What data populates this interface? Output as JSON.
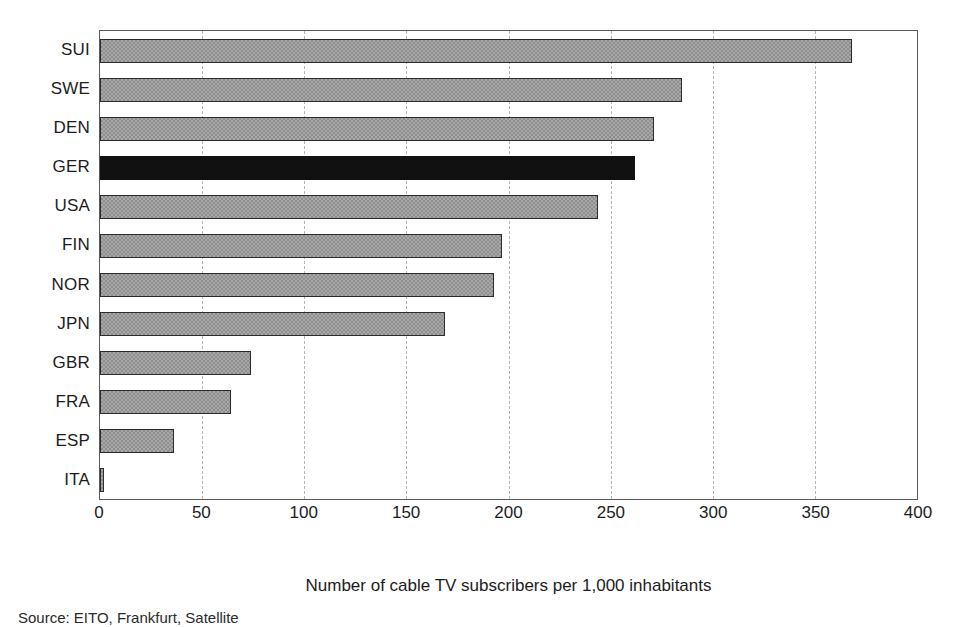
{
  "chart_data": {
    "type": "bar",
    "orientation": "horizontal",
    "title": "",
    "xlabel": "Number of cable TV subscribers per 1,000 inhabitants",
    "ylabel": "",
    "xlim": [
      0,
      400
    ],
    "xticks": [
      0,
      50,
      100,
      150,
      200,
      250,
      300,
      350,
      400
    ],
    "grid": true,
    "legend": false,
    "categories": [
      "SUI",
      "SWE",
      "DEN",
      "GER",
      "USA",
      "FIN",
      "NOR",
      "JPN",
      "GBR",
      "FRA",
      "ESP",
      "ITA"
    ],
    "values": [
      368,
      285,
      271,
      262,
      244,
      197,
      193,
      169,
      74,
      64,
      36,
      2
    ],
    "highlight_category": "GER",
    "bars": [
      {
        "category": "SUI",
        "value": 368,
        "style": "hatched"
      },
      {
        "category": "SWE",
        "value": 285,
        "style": "hatched"
      },
      {
        "category": "DEN",
        "value": 271,
        "style": "hatched"
      },
      {
        "category": "GER",
        "value": 262,
        "style": "solid-black"
      },
      {
        "category": "USA",
        "value": 244,
        "style": "hatched"
      },
      {
        "category": "FIN",
        "value": 197,
        "style": "hatched"
      },
      {
        "category": "NOR",
        "value": 193,
        "style": "hatched"
      },
      {
        "category": "JPN",
        "value": 169,
        "style": "hatched"
      },
      {
        "category": "GBR",
        "value": 74,
        "style": "hatched"
      },
      {
        "category": "FRA",
        "value": 64,
        "style": "hatched"
      },
      {
        "category": "ESP",
        "value": 36,
        "style": "hatched"
      },
      {
        "category": "ITA",
        "value": 2,
        "style": "hatched"
      }
    ],
    "colors": {
      "bar_fill": "#a8a8a8",
      "bar_border": "#2b2b2b",
      "highlight_fill": "#111111",
      "gridline": "#b4b4b4",
      "axis": "#5a5a5a",
      "background": "#ffffff",
      "text": "#1c1c1c"
    }
  },
  "axis": {
    "tick_labels": [
      "0",
      "50",
      "100",
      "150",
      "200",
      "250",
      "300",
      "350",
      "400"
    ],
    "title": "Number of cable TV subscribers per 1,000 inhabitants"
  },
  "footer": {
    "source_note": "Source: EITO, Frankfurt, Satellite"
  }
}
